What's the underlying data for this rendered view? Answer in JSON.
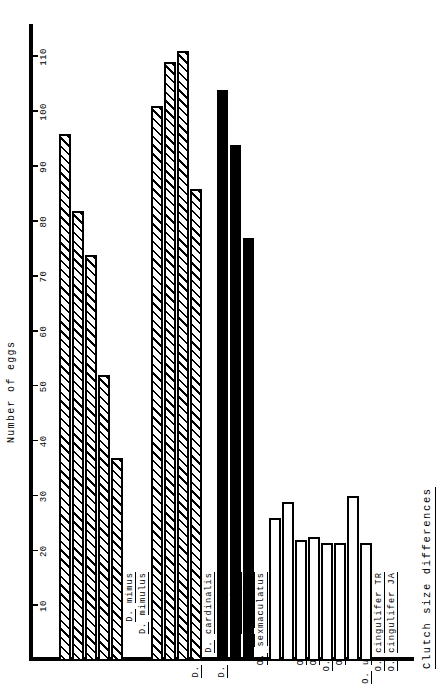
{
  "figure": {
    "title": "Clutch size differences",
    "value_axis_label": "Number of eggs"
  },
  "axis": {
    "ticks": [
      10,
      20,
      30,
      40,
      50,
      60,
      70,
      80,
      90,
      100,
      110
    ],
    "min": 0,
    "max": 116
  },
  "chart_data": {
    "type": "bar",
    "title": "Clutch size differences",
    "xlabel": "",
    "ylabel": "Number of eggs",
    "orientation": "horizontal",
    "ylim": [
      0,
      116
    ],
    "grid": false,
    "legend": "none",
    "tick_labels": [
      "10",
      "20",
      "30",
      "40",
      "50",
      "60",
      "70",
      "80",
      "90",
      "100",
      "110"
    ],
    "groups": [
      {
        "genus": "Dysdercus",
        "subgroup": "American",
        "fill": "hatched",
        "categories": [
          "D. bimaculatus",
          "D. suturellus",
          "D. andreae",
          "D. mimus",
          "D. mimulus"
        ],
        "values": [
          96,
          82,
          74,
          52,
          37
        ]
      },
      {
        "genus": "Dysdercus",
        "subgroup": "African",
        "fill": "hatched",
        "categories": [
          "D. fasciatus",
          "D. nigrafasciatus",
          "D. cardinalis",
          "D. superstitiosus"
        ],
        "values": [
          101,
          109,
          111,
          86
        ]
      },
      {
        "genus": "Oncopeltus",
        "subgroup": "",
        "fill": "solid",
        "categories": [
          "O. varicolor",
          "O. sexmaculatus",
          "O. cayensis"
        ],
        "values": [
          104,
          94,
          77
        ]
      },
      {
        "genus": "",
        "subgroup": "Erithrischius",
        "fill": "open",
        "categories": [
          "O. fasciatus IA",
          "O. fasciatus PR",
          "O. sandarachatus",
          "O. longirostris",
          "O. aulicus",
          "O. unifasciatellus",
          "O. cingulifer TR",
          "O. cingulifer JA"
        ],
        "values": [
          26,
          29,
          22,
          22.5,
          21.5,
          21.5,
          30,
          21.5
        ]
      }
    ]
  },
  "labels": {
    "rows": [
      {
        "kind": "head",
        "text": "Dysdercus",
        "gap_before": 0
      },
      {
        "kind": "head",
        "text": "American",
        "indent": 10
      },
      {
        "kind": "item",
        "abbr": "D.",
        "species": "bimaculatus"
      },
      {
        "kind": "item",
        "abbr": "D.",
        "species": "suturellus"
      },
      {
        "kind": "item",
        "abbr": "D.",
        "species": "andreae"
      },
      {
        "kind": "item",
        "abbr": "D.",
        "species": "mimus"
      },
      {
        "kind": "item",
        "abbr": "D.",
        "species": "mimulus"
      },
      {
        "kind": "head",
        "text": "African",
        "indent": 10
      },
      {
        "kind": "item",
        "abbr": "D.",
        "species": "fasciatus"
      },
      {
        "kind": "item",
        "abbr": "D.",
        "species": "nigrafasciatus"
      },
      {
        "kind": "item",
        "abbr": "D.",
        "species": "cardinalis"
      },
      {
        "kind": "item",
        "abbr": "D.",
        "species": "superstitiosus"
      },
      {
        "kind": "head",
        "text": "Oncopeltus",
        "indent": 0
      },
      {
        "kind": "item",
        "abbr": "O.",
        "species": "varicolor"
      },
      {
        "kind": "item",
        "abbr": "O.",
        "species": "sexmaculatus"
      },
      {
        "kind": "item",
        "abbr": "O.",
        "species": "cayensis"
      },
      {
        "kind": "head",
        "text": "Erithrischius",
        "indent": 0
      },
      {
        "kind": "item",
        "abbr": "O.",
        "species": "fasciatus IA"
      },
      {
        "kind": "item",
        "abbr": "O.",
        "species": "fasciatus PR"
      },
      {
        "kind": "item",
        "abbr": "O.",
        "species": "sandarachatus"
      },
      {
        "kind": "item",
        "abbr": "O.",
        "species": "longirostris"
      },
      {
        "kind": "item",
        "abbr": "O.",
        "species": "aulicus"
      },
      {
        "kind": "item",
        "abbr": "O.",
        "species": "unifasciatellus"
      },
      {
        "kind": "item",
        "abbr": "O.",
        "species": "cingulifer TR"
      },
      {
        "kind": "item",
        "abbr": "O.",
        "species": "cingulifer JA"
      }
    ]
  },
  "colors": {
    "ink": "#000000",
    "paper": "#ffffff"
  }
}
